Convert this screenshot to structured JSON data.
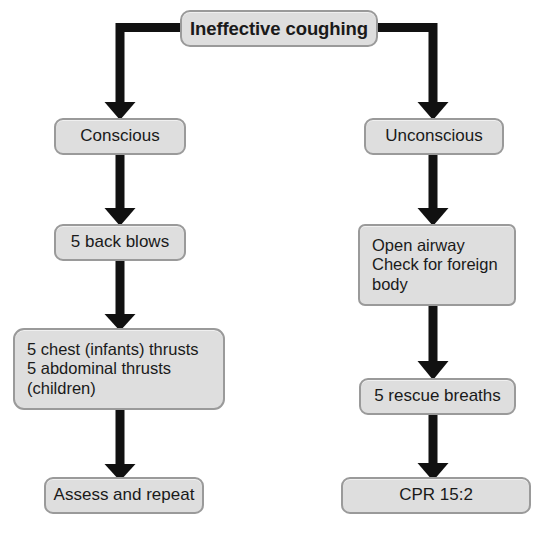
{
  "figure": {
    "type": "flowchart",
    "title": "Ineffective coughing",
    "orientation": "top-down",
    "branches": 2,
    "background_color": "#ffffff",
    "node_fill_color": "#dedede",
    "node_border_color": "#9a9a9a",
    "connector_color": "#111111",
    "text_color": "#1a1a1a"
  },
  "nodes": {
    "root": {
      "id": "ineffective-coughing",
      "label": "Ineffective coughing",
      "x": 180,
      "y": 10,
      "width": 198,
      "height": 37
    },
    "conscious": {
      "id": "conscious",
      "label": "Conscious",
      "x": 54,
      "y": 118,
      "width": 132,
      "height": 37
    },
    "unconscious": {
      "id": "unconscious",
      "label": "Unconscious",
      "x": 364,
      "y": 118,
      "width": 140,
      "height": 37
    },
    "back_blows": {
      "id": "5-back-blows",
      "label": "5 back blows",
      "x": 54,
      "y": 224,
      "width": 132,
      "height": 37
    },
    "open_airway": {
      "id": "open-airway-check-foreign-body",
      "label": "Open airway\nCheck for foreign\nbody",
      "x": 358,
      "y": 224,
      "width": 158,
      "height": 82
    },
    "thrusts": {
      "id": "chest-abdominal-thrusts",
      "label": "5 chest (infants) thrusts\n5 abdominal thrusts\n(children)",
      "x": 13,
      "y": 328,
      "width": 212,
      "height": 82
    },
    "rescue_breaths": {
      "id": "5-rescue-breaths",
      "label": "5 rescue breaths",
      "x": 359,
      "y": 378,
      "width": 157,
      "height": 37
    },
    "assess": {
      "id": "assess-and-repeat",
      "label": "Assess and repeat",
      "x": 44,
      "y": 477,
      "width": 160,
      "height": 37
    },
    "cpr": {
      "id": "cpr-15-2",
      "label": "CPR 15:2",
      "x": 341,
      "y": 477,
      "width": 190,
      "height": 37
    }
  },
  "connectors": [
    {
      "id": "root-to-conscious",
      "from": "root",
      "to": "conscious",
      "style": "elbow-left-arrow"
    },
    {
      "id": "root-to-unconscious",
      "from": "root",
      "to": "unconscious",
      "style": "elbow-right-arrow"
    },
    {
      "id": "conscious-to-back-blows",
      "from": "conscious",
      "to": "back_blows",
      "style": "straight-arrow"
    },
    {
      "id": "back-blows-to-thrusts",
      "from": "back_blows",
      "to": "thrusts",
      "style": "straight-arrow"
    },
    {
      "id": "thrusts-to-assess",
      "from": "thrusts",
      "to": "assess",
      "style": "straight-arrow"
    },
    {
      "id": "unconscious-to-open-airway",
      "from": "unconscious",
      "to": "open_airway",
      "style": "straight-arrow"
    },
    {
      "id": "open-airway-to-rescue-breaths",
      "from": "open_airway",
      "to": "rescue_breaths",
      "style": "straight-arrow"
    },
    {
      "id": "rescue-breaths-to-cpr",
      "from": "rescue_breaths",
      "to": "cpr",
      "style": "straight-arrow"
    }
  ],
  "caption": {
    "text": "",
    "visible_fragment": ""
  }
}
